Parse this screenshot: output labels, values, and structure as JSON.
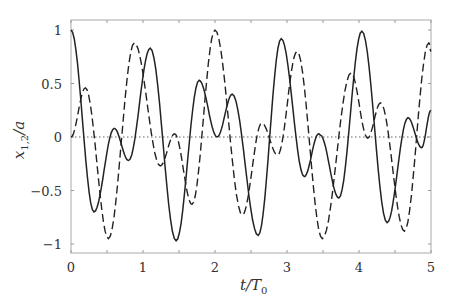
{
  "chart_data": {
    "type": "line",
    "title": "",
    "xlabel": "t/T0",
    "ylabel": "x1,2/a",
    "xlim": [
      0,
      5
    ],
    "ylim": [
      -1.1,
      1.1
    ],
    "xticks": [
      0,
      1,
      2,
      3,
      4,
      5
    ],
    "xtick_labels": [
      "0",
      "1",
      "2",
      "3",
      "4",
      "5"
    ],
    "yticks": [
      -1,
      -0.5,
      0,
      0.5,
      1
    ],
    "ytick_labels": [
      "−1",
      "−0.5",
      "0",
      "0.5",
      "1"
    ],
    "minor_xticks": [
      0.5,
      1.5,
      2.5,
      3.5,
      4.5
    ],
    "grid": false,
    "legend": null,
    "reference_line": {
      "y": 0,
      "style": "dotted"
    },
    "series": [
      {
        "name": "x1",
        "style": "solid",
        "color": "#222222",
        "x": [
          0,
          0.32,
          0.6,
          0.8,
          1.1,
          1.46,
          1.78,
          2.03,
          2.24,
          2.6,
          2.92,
          3.24,
          3.44,
          3.46,
          3.72,
          4.04,
          4.39,
          4.68,
          4.87,
          5.0
        ],
        "y": [
          1.0,
          -0.7,
          0.08,
          -0.22,
          0.83,
          -0.97,
          0.53,
          0.0,
          0.4,
          -0.92,
          0.92,
          -0.37,
          0.03,
          0.02,
          -0.57,
          0.99,
          -0.8,
          0.18,
          -0.1,
          0.25
        ]
      },
      {
        "name": "x2",
        "style": "dashed",
        "color": "#222222",
        "x": [
          0,
          0.2,
          0.52,
          0.88,
          1.24,
          1.44,
          1.68,
          2.0,
          2.38,
          2.65,
          2.87,
          3.14,
          3.49,
          3.89,
          4.12,
          4.3,
          4.63,
          4.97,
          5.0
        ],
        "y": [
          0.0,
          0.46,
          -0.95,
          0.88,
          -0.27,
          0.03,
          -0.63,
          1.0,
          -0.73,
          0.13,
          -0.17,
          0.8,
          -0.95,
          0.6,
          -0.01,
          0.32,
          -0.88,
          0.88,
          0.8
        ]
      }
    ]
  },
  "axes": {
    "xlabel_main": "t/T",
    "xlabel_sub": "0",
    "ylabel_main": "x",
    "ylabel_sub": "1,2",
    "ylabel_tail": "/a"
  }
}
